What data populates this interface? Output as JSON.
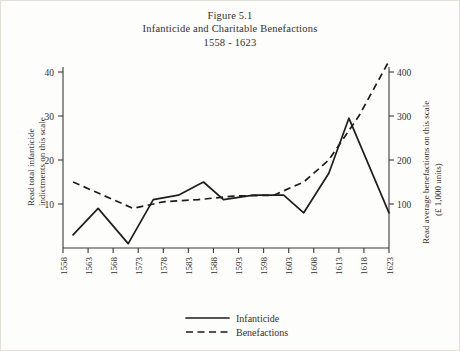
{
  "figure": {
    "title_line_1": "Figure 5.1",
    "title_line_2": "Infanticide and Charitable Benefactions",
    "title_line_3": "1558 - 1623"
  },
  "axes": {
    "left_title_line_1": "Read total infanticide",
    "left_title_line_2": "indictments on this scale",
    "right_title_line_1": "Read average benefactions on this scale",
    "right_title_line_2": "(£ 1,000 units)"
  },
  "legend": {
    "entries": [
      {
        "label": "Infanticide",
        "style": "solid",
        "color": "#1d1d1d"
      },
      {
        "label": "Benefactions",
        "style": "dashed",
        "color": "#1d1d1d"
      }
    ]
  },
  "chart_data": {
    "type": "line",
    "xlabel": "",
    "ylabel": "Read total infanticide indictments on this scale",
    "y2label": "Read average benefactions on this scale (£ 1,000 units)",
    "grid": false,
    "legend_position": "bottom-center",
    "categories": [
      "1558",
      "1563",
      "1568",
      "1573",
      "1578",
      "1583",
      "1588",
      "1593",
      "1598",
      "1603",
      "1608",
      "1613",
      "1618",
      "1623"
    ],
    "xlim": [
      1558,
      1623
    ],
    "xticks": [
      1558,
      1563,
      1568,
      1573,
      1578,
      1583,
      1588,
      1593,
      1598,
      1603,
      1608,
      1613,
      1618,
      1623
    ],
    "ylim": [
      0,
      40
    ],
    "yticks": [
      10,
      20,
      30,
      40
    ],
    "ytick_labels": [
      "10",
      "20",
      "30",
      "40"
    ],
    "y2lim": [
      0,
      400
    ],
    "y2ticks": [
      100,
      200,
      300,
      400
    ],
    "y2tick_labels": [
      "100",
      "200",
      "300",
      "400"
    ],
    "series": [
      {
        "name": "Infanticide",
        "axis": "left",
        "style": "solid",
        "x": [
          1560,
          1565,
          1571,
          1576,
          1581,
          1586,
          1590,
          1596,
          1602,
          1606,
          1611,
          1615,
          1623
        ],
        "values": [
          3,
          9,
          1,
          11,
          12,
          15,
          11,
          12,
          12,
          8,
          17,
          29.5,
          8
        ]
      },
      {
        "name": "Benefactions",
        "axis": "right",
        "style": "dashed",
        "x": [
          1560,
          1566,
          1572,
          1578,
          1585,
          1592,
          1600,
          1606,
          1611,
          1617,
          1623
        ],
        "values": [
          150,
          120,
          90,
          105,
          110,
          118,
          120,
          150,
          200,
          300,
          425
        ]
      }
    ]
  }
}
